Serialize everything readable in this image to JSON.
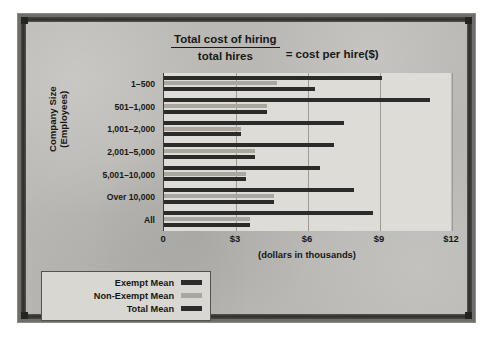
{
  "title": {
    "numerator": "Total cost of hiring",
    "denominator": "total hires",
    "equals": "= cost per hire($)"
  },
  "axes": {
    "y_title_line1": "Company Size",
    "y_title_line2": "(Employees)",
    "x_title": "(dollars in thousands)"
  },
  "colors": {
    "exempt": "#2b2b28",
    "nonexempt": "#a9a7a0",
    "total": "#2b2b28",
    "plot_background": "#dedcd6",
    "poster_background": "#b9b8b4",
    "frame": "#2f2e2b",
    "gridline": "#9d9b94"
  },
  "legend": {
    "items": [
      {
        "label": "Exempt Mean",
        "color": "#2b2b28"
      },
      {
        "label": "Non-Exempt Mean",
        "color": "#a9a7a0"
      },
      {
        "label": "Total Mean",
        "color": "#2b2b28"
      }
    ]
  },
  "chart_data": {
    "type": "bar",
    "orientation": "horizontal",
    "xlabel": "(dollars in thousands)",
    "ylabel": "Company Size (Employees)",
    "xlim": [
      0,
      12
    ],
    "xticks": [
      0,
      3,
      6,
      9,
      12
    ],
    "xticklabels": [
      "0",
      "$3",
      "$6",
      "$9",
      "$12"
    ],
    "grid": true,
    "legend_position": "below-left",
    "categories": [
      "1-500",
      "501-1,000",
      "1,001-2,000",
      "2,001-5,000",
      "5,001-10,000",
      "Over 10,000",
      "All"
    ],
    "series": [
      {
        "name": "Exempt Mean",
        "color": "#2b2b28",
        "values": [
          9.1,
          11.1,
          7.5,
          7.1,
          6.5,
          7.9,
          8.7
        ]
      },
      {
        "name": "Non-Exempt Mean",
        "color": "#a9a7a0",
        "values": [
          4.7,
          4.3,
          3.2,
          3.8,
          3.4,
          4.6,
          3.6
        ]
      },
      {
        "name": "Total Mean",
        "color": "#2b2b28",
        "values": [
          6.3,
          4.3,
          3.2,
          3.8,
          3.4,
          4.6,
          3.6
        ]
      }
    ]
  }
}
